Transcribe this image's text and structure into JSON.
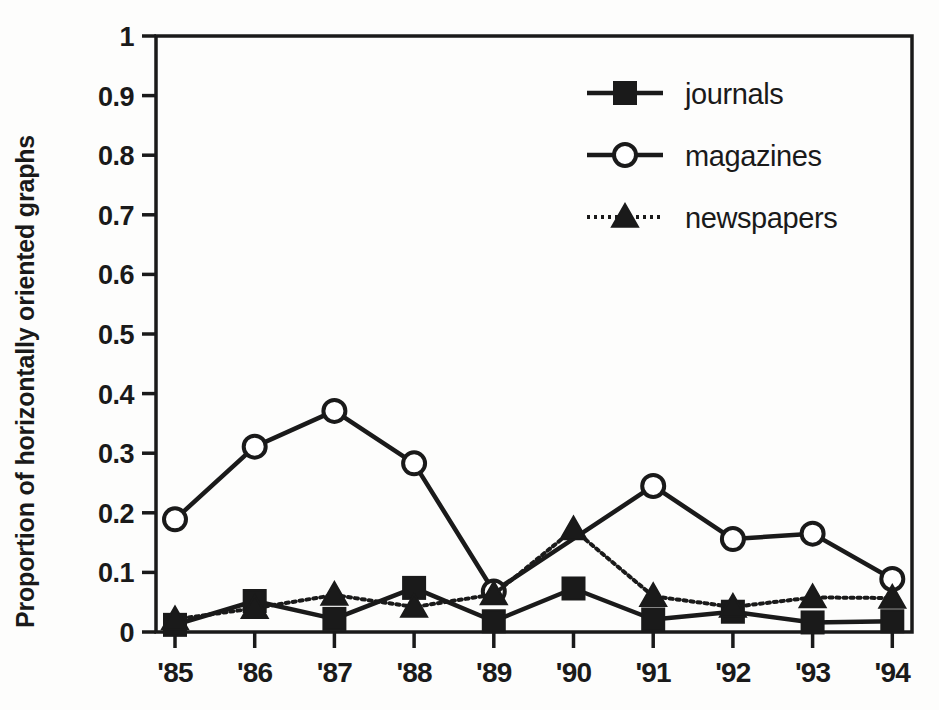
{
  "chart_data": {
    "type": "line",
    "title": "",
    "xlabel": "",
    "ylabel": "Proportion of horizontally oriented graphs",
    "categories": [
      "'85",
      "'86",
      "'87",
      "'88",
      "'89",
      "'90",
      "'91",
      "'92",
      "'93",
      "'94"
    ],
    "ylim": [
      0,
      1
    ],
    "xlim_labels": [
      "'85",
      "'94"
    ],
    "ytick_labels": [
      "0",
      "0.1",
      "0.2",
      "0.3",
      "0.4",
      "0.5",
      "0.6",
      "0.7",
      "0.8",
      "0.9",
      "1"
    ],
    "ytick_values": [
      0,
      0.1,
      0.2,
      0.3,
      0.4,
      0.5,
      0.6,
      0.7,
      0.8,
      0.9,
      1
    ],
    "grid": false,
    "legend_position": "top-right",
    "series": [
      {
        "name": "journals",
        "marker": "filled-square",
        "line_style": "solid",
        "color": "#1a1a1a",
        "values": [
          0.012,
          0.052,
          0.022,
          0.074,
          0.018,
          0.073,
          0.021,
          0.034,
          0.016,
          0.018
        ]
      },
      {
        "name": "magazines",
        "marker": "open-circle",
        "line_style": "solid",
        "color": "#1a1a1a",
        "values": [
          0.189,
          0.311,
          0.371,
          0.283,
          0.068,
          null,
          0.245,
          0.156,
          0.165,
          0.089
        ]
      },
      {
        "name": "newspapers",
        "marker": "filled-triangle",
        "line_style": "dotted",
        "color": "#1a1a1a",
        "values": [
          0.021,
          0.04,
          0.062,
          0.042,
          0.063,
          0.172,
          0.06,
          0.042,
          0.058,
          0.057
        ]
      }
    ]
  },
  "legend": {
    "items": [
      {
        "label": "journals"
      },
      {
        "label": "magazines"
      },
      {
        "label": "newspapers"
      }
    ]
  },
  "axes": {
    "y_title": "Proportion of horizontally oriented graphs"
  },
  "colors": {
    "ink": "#1a1a1a",
    "background": "#fdfdfc"
  }
}
